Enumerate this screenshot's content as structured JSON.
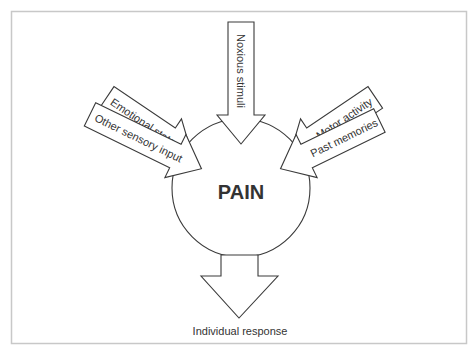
{
  "diagram": {
    "center": {
      "label": "PAIN"
    },
    "inputs": [
      {
        "label": "Other sensory input",
        "angle_deg": 153
      },
      {
        "label": "Emotional state",
        "angle_deg": 124
      },
      {
        "label": "Noxious stimuli",
        "angle_deg": 90
      },
      {
        "label": "Motor activity",
        "angle_deg": 56
      },
      {
        "label": "Past memories",
        "angle_deg": 27
      }
    ],
    "output": {
      "label": "Individual response"
    }
  },
  "colors": {
    "stroke": "#3a3a3a",
    "frame": "#c8c8c8",
    "fill": "#ffffff"
  }
}
